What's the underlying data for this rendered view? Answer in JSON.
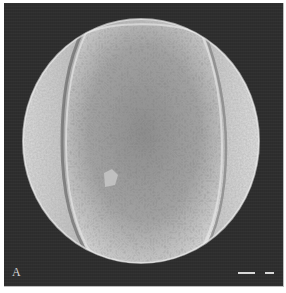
{
  "figure": {
    "panel_label": "A",
    "scale_bars": [
      {
        "position": "bottom-right",
        "length_px": 17
      },
      {
        "position": "bottom-right",
        "length_px": 9
      }
    ],
    "colors": {
      "background": "#2e2e2e",
      "grain_light": "#e6e6e6",
      "grain_mid": "#a8a8a8",
      "grain_shadow": "#6e6e6e",
      "scale_bar": "#d9d9d9"
    }
  }
}
